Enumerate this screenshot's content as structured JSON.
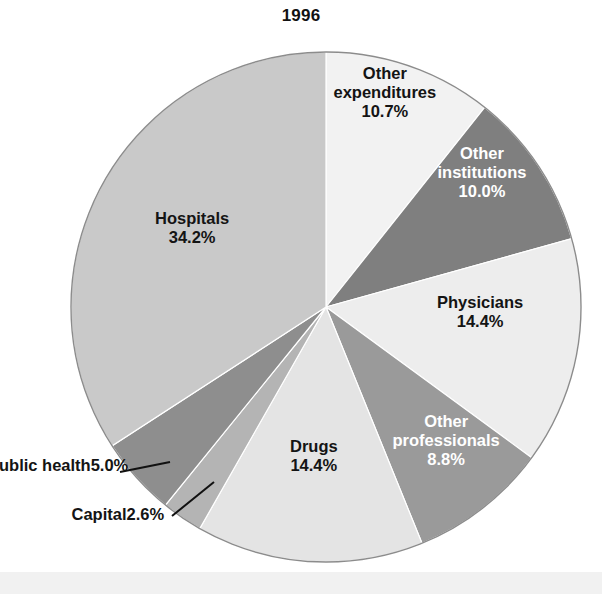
{
  "chart": {
    "title": "1996",
    "type": "pie"
  },
  "chart_data": {
    "type": "pie",
    "title": "1996",
    "subtitle": "",
    "xlabel": "",
    "ylabel": "",
    "legend_position": "none",
    "grid": false,
    "start_angle_deg": 0,
    "direction": "clockwise",
    "units": "percent",
    "categories": [
      "Other expenditures",
      "Other institutions",
      "Physicians",
      "Other professionals",
      "Drugs",
      "Capital",
      "Public health",
      "Hospitals"
    ],
    "values": [
      10.7,
      10.0,
      14.4,
      8.8,
      14.4,
      2.6,
      5.0,
      34.2
    ],
    "slices": [
      {
        "name": "Other expenditures",
        "value": 10.7,
        "value_label": "10.7%",
        "label_lines": [
          "Other",
          "expenditures"
        ],
        "color": "#f2f2f2",
        "label_color": "#141414",
        "label_placement": "inside",
        "label_x": 385,
        "label_y": 92
      },
      {
        "name": "Other institutions",
        "value": 10.0,
        "value_label": "10.0%",
        "label_lines": [
          "Other",
          "institutions"
        ],
        "color": "#7f7f7f",
        "label_color": "#ffffff",
        "label_placement": "inside",
        "label_x": 482,
        "label_y": 172
      },
      {
        "name": "Physicians",
        "value": 14.4,
        "value_label": "14.4%",
        "label_lines": [
          "Physicians"
        ],
        "color": "#ededed",
        "label_color": "#141414",
        "label_placement": "inside",
        "label_x": 480,
        "label_y": 312
      },
      {
        "name": "Other professionals",
        "value": 8.8,
        "value_label": "8.8%",
        "label_lines": [
          "Other",
          "professionals"
        ],
        "color": "#9a9a9a",
        "label_color": "#ffffff",
        "label_placement": "inside",
        "label_x": 446,
        "label_y": 440
      },
      {
        "name": "Drugs",
        "value": 14.4,
        "value_label": "14.4%",
        "label_lines": [
          "Drugs"
        ],
        "color": "#e4e4e4",
        "label_color": "#141414",
        "label_placement": "inside",
        "label_x": 314,
        "label_y": 456
      },
      {
        "name": "Capital",
        "value": 2.6,
        "value_label": "2.6%",
        "label_lines": [
          "Capital"
        ],
        "color": "#b4b4b4",
        "label_color": "#141414",
        "label_placement": "outside",
        "label_x": 118,
        "label_y": 514,
        "leader": {
          "x1": 172,
          "y1": 516,
          "x2": 214,
          "y2": 482
        }
      },
      {
        "name": "Public health",
        "value": 5.0,
        "value_label": "5.0%",
        "label_lines": [
          "Public health"
        ],
        "color": "#8e8e8e",
        "label_color": "#141414",
        "label_placement": "outside",
        "label_x": 58,
        "label_y": 465,
        "leader": {
          "x1": 120,
          "y1": 472,
          "x2": 170,
          "y2": 462
        }
      },
      {
        "name": "Hospitals",
        "value": 34.2,
        "value_label": "34.2%",
        "label_lines": [
          "Hospitals"
        ],
        "color": "#c9c9c9",
        "label_color": "#141414",
        "label_placement": "inside",
        "label_x": 192,
        "label_y": 228
      }
    ],
    "geometry": {
      "center_x": 326,
      "center_y": 307,
      "radius": 255
    },
    "total": 100.1
  }
}
